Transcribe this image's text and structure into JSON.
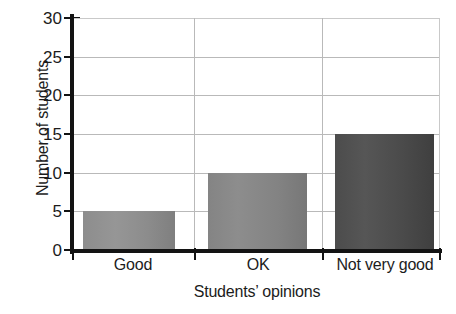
{
  "chart_data": {
    "type": "bar",
    "title": "",
    "xlabel": "Students’ opinions",
    "ylabel": "Number of students",
    "categories": [
      "Good",
      "OK",
      "Not very good"
    ],
    "values": [
      5,
      10,
      15
    ],
    "ylim": [
      0,
      30
    ],
    "yticks": [
      0,
      5,
      10,
      15,
      20,
      25,
      30
    ],
    "ytick_labels": [
      "0",
      "5",
      "10",
      "15",
      "20",
      "25",
      "30"
    ],
    "grid": "horizontal-and-vertical",
    "legend": "none",
    "bar_colors": [
      "#8d8d8d",
      "#848484",
      "#4c4c4c"
    ],
    "axis_color": "#131313",
    "grid_color": "#b9b9b9"
  },
  "axes": {
    "y_title": "Number of students",
    "x_title": "Students’ opinions"
  },
  "ticks": {
    "y": [
      {
        "label": "30",
        "value": 30
      },
      {
        "label": "25",
        "value": 25
      },
      {
        "label": "20",
        "value": 20
      },
      {
        "label": "15",
        "value": 15
      },
      {
        "label": "10",
        "value": 10
      },
      {
        "label": "5",
        "value": 5
      },
      {
        "label": "0",
        "value": 0
      }
    ],
    "x": [
      {
        "label": "Good",
        "value": 5
      },
      {
        "label": "OK",
        "value": 10
      },
      {
        "label": "Not very good",
        "value": 15
      }
    ]
  }
}
